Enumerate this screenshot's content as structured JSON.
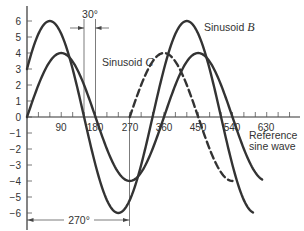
{
  "chart_data": {
    "type": "line",
    "title": "",
    "xlabel": "",
    "ylabel": "",
    "xlim": [
      0,
      690
    ],
    "ylim": [
      -6.5,
      7
    ],
    "grid": false,
    "x_ticks": [
      90,
      180,
      270,
      360,
      450,
      540,
      630
    ],
    "x_minor_tick_step": 30,
    "y_ticks": [
      6,
      5,
      4,
      3,
      2,
      1,
      0,
      -1,
      -2,
      -3,
      -4,
      -5,
      -6
    ],
    "series": [
      {
        "name": "Reference sine wave",
        "formula": "4*sin(theta)",
        "amplitude": 4,
        "phase_deg": 0,
        "x_range": [
          0,
          620
        ],
        "style": "solid",
        "sample_points": {
          "x": [
            0,
            90,
            180,
            270,
            360,
            450,
            540,
            620
          ],
          "y": [
            0,
            4,
            0,
            -4,
            0,
            4,
            0,
            -3.9
          ]
        }
      },
      {
        "name": "Sinusoid B",
        "formula": "6*sin(theta+30)",
        "amplitude": 6,
        "phase_deg": 30,
        "x_range": [
          0,
          595
        ],
        "style": "solid",
        "sample_points": {
          "x": [
            0,
            60,
            150,
            240,
            330,
            420,
            510,
            595
          ],
          "y": [
            3,
            6,
            0,
            -6,
            0,
            6,
            0,
            -5.9
          ]
        }
      },
      {
        "name": "Sinusoid C",
        "formula": "4*sin(theta-270)",
        "amplitude": 4,
        "phase_deg": -270,
        "x_range": [
          270,
          540
        ],
        "style": "dashed",
        "sample_points": {
          "x": [
            270,
            360,
            450,
            540
          ],
          "y": [
            0,
            4,
            0,
            -4
          ]
        }
      }
    ],
    "annotations": [
      {
        "text": "30°",
        "type": "dimension",
        "from_x": 150,
        "to_x": 180
      },
      {
        "text": "270°",
        "type": "dimension",
        "from_x": 0,
        "to_x": 270
      },
      {
        "text": "Sinusoid B",
        "type": "label"
      },
      {
        "text": "Sinusoid C",
        "type": "label"
      },
      {
        "text": "Reference sine wave",
        "type": "label"
      }
    ]
  },
  "labels": {
    "sinusoid_b_prefix": "Sinusoid ",
    "sinusoid_b_var": "B",
    "sinusoid_c_prefix": "Sinusoid ",
    "sinusoid_c_var": "C",
    "reference_line1": "Reference",
    "reference_line2": "sine wave",
    "dim_30": "30°",
    "dim_270": "270°"
  },
  "axis": {
    "x_tick_labels": [
      "90",
      "180",
      "270",
      "360",
      "450",
      "540",
      "630"
    ],
    "y_tick_labels": [
      "6",
      "5",
      "4",
      "3",
      "2",
      "1",
      "0",
      "−1",
      "−2",
      "−3",
      "−4",
      "−5",
      "−6"
    ]
  }
}
